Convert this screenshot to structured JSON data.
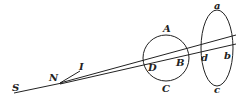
{
  "diagram": {
    "labels": {
      "S": "S",
      "N": "N",
      "I": "I",
      "A": "A",
      "B": "B",
      "C": "C",
      "D": "D",
      "a": "a",
      "b": "b",
      "c": "c",
      "d": "d"
    },
    "colors": {
      "stroke": "#222222",
      "background": "#ffffff"
    }
  }
}
